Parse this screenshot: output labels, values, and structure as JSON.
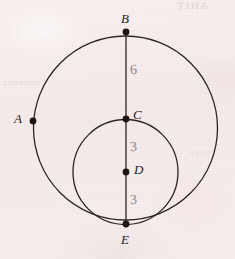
{
  "page": {
    "kind": "scanned-textbook-figure",
    "width": 235,
    "height": 259,
    "paper_color": "#f6edec",
    "ink_color": "#241c1c",
    "pencil_color": "#8c8686"
  },
  "bleed_through": {
    "top_right": "AHIT",
    "mid_left": "nnnnnnn",
    "mid_right": "nnnn"
  },
  "figure": {
    "points": [
      {
        "id": "B",
        "label": "B",
        "x": 126,
        "y": 32,
        "label_x": 121,
        "label_y": 12
      },
      {
        "id": "A",
        "label": "A",
        "x": 33,
        "y": 121,
        "label_x": 14,
        "label_y": 112
      },
      {
        "id": "C",
        "label": "C",
        "x": 126,
        "y": 119,
        "label_x": 133,
        "label_y": 108
      },
      {
        "id": "D",
        "label": "D",
        "x": 126,
        "y": 172,
        "label_x": 134,
        "label_y": 163
      },
      {
        "id": "E",
        "label": "E",
        "x": 126,
        "y": 224,
        "label_x": 121,
        "label_y": 233
      }
    ],
    "circles": [
      {
        "id": "large-circle",
        "cx": 125.5,
        "cy": 128,
        "r": 92
      },
      {
        "id": "small-circle",
        "cx": 125.5,
        "cy": 172,
        "r": 52.5
      }
    ],
    "segment": {
      "id": "diameter-BE",
      "x1": 126,
      "y1": 32,
      "x2": 126,
      "y2": 224
    },
    "measurements": [
      {
        "id": "segment-BC",
        "value": "6",
        "x": 130,
        "y": 63
      },
      {
        "id": "segment-CD",
        "value": "3",
        "x": 130,
        "y": 140
      },
      {
        "id": "segment-DE",
        "value": "3",
        "x": 130,
        "y": 193
      }
    ]
  }
}
